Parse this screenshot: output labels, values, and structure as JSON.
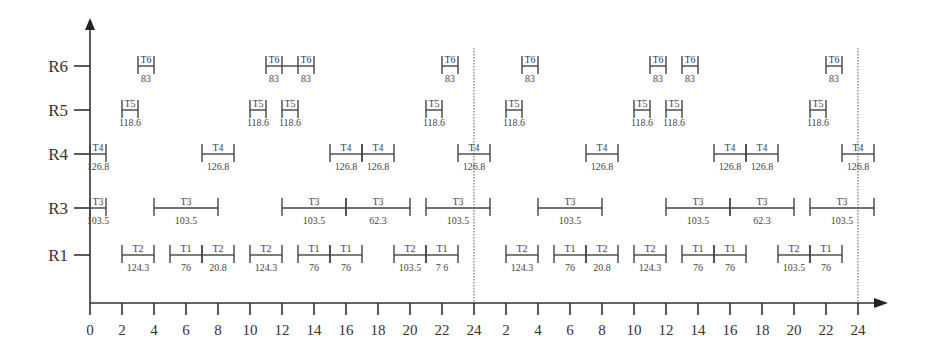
{
  "chart_data": {
    "type": "gantt",
    "title": "",
    "xlabel": "",
    "ylabel": "",
    "x_tick_labels": [
      "0",
      "2",
      "4",
      "6",
      "8",
      "10",
      "12",
      "14",
      "16",
      "18",
      "20",
      "22",
      "24",
      "2",
      "4",
      "6",
      "8",
      "10",
      "12",
      "14",
      "16",
      "18",
      "20",
      "22",
      "24"
    ],
    "x_range_hours": [
      0,
      48
    ],
    "dotted_vertical_lines_at_hours": [
      24,
      48
    ],
    "rows": [
      "R6",
      "R5",
      "R4",
      "R3",
      "R1"
    ],
    "bars": {
      "R6": [
        {
          "task": "T6",
          "value": "83",
          "start": 3,
          "end": 4
        },
        {
          "task": "T6",
          "value": "83",
          "start": 11,
          "end": 12
        },
        {
          "task": "T6",
          "value": "83",
          "start": 13,
          "end": 14
        },
        {
          "task": "T6",
          "value": "83",
          "start": 22,
          "end": 23
        },
        {
          "task": "T6",
          "value": "83",
          "start": 27,
          "end": 28
        },
        {
          "task": "T6",
          "value": "83",
          "start": 35,
          "end": 36
        },
        {
          "task": "T6",
          "value": "83",
          "start": 37,
          "end": 38
        },
        {
          "task": "T6",
          "value": "83",
          "start": 46,
          "end": 47
        }
      ],
      "R5": [
        {
          "task": "T5",
          "value": "118.6",
          "start": 2,
          "end": 3
        },
        {
          "task": "T5",
          "value": "118.6",
          "start": 10,
          "end": 11
        },
        {
          "task": "T5",
          "value": "118.6",
          "start": 12,
          "end": 13
        },
        {
          "task": "T5",
          "value": "118.6",
          "start": 21,
          "end": 22
        },
        {
          "task": "T5",
          "value": "118.6",
          "start": 26,
          "end": 27
        },
        {
          "task": "T5",
          "value": "118.6",
          "start": 34,
          "end": 35
        },
        {
          "task": "T5",
          "value": "118.6",
          "start": 36,
          "end": 37
        },
        {
          "task": "T5",
          "value": "118.6",
          "start": 45,
          "end": 46
        }
      ],
      "R4": [
        {
          "task": "T4",
          "value": "126.8",
          "start": 0,
          "end": 1
        },
        {
          "task": "T4",
          "value": "126.8",
          "start": 7,
          "end": 9
        },
        {
          "task": "T4",
          "value": "126.8",
          "start": 15,
          "end": 17
        },
        {
          "task": "T4",
          "value": "126.8",
          "start": 17,
          "end": 19
        },
        {
          "task": "T4",
          "value": "126.8",
          "start": 23,
          "end": 25
        },
        {
          "task": "T4",
          "value": "126.8",
          "start": 31,
          "end": 33
        },
        {
          "task": "T4",
          "value": "126.8",
          "start": 39,
          "end": 41
        },
        {
          "task": "T4",
          "value": "126.8",
          "start": 41,
          "end": 43
        },
        {
          "task": "T4",
          "value": "126.8",
          "start": 47,
          "end": 49
        }
      ],
      "R3": [
        {
          "task": "T3",
          "value": "103.5",
          "start": 0,
          "end": 1
        },
        {
          "task": "T3",
          "value": "103.5",
          "start": 4,
          "end": 8
        },
        {
          "task": "T3",
          "value": "103.5",
          "start": 12,
          "end": 16
        },
        {
          "task": "T3",
          "value": "62.3",
          "start": 16,
          "end": 20
        },
        {
          "task": "T3",
          "value": "103.5",
          "start": 21,
          "end": 25
        },
        {
          "task": "T3",
          "value": "103.5",
          "start": 28,
          "end": 32
        },
        {
          "task": "T3",
          "value": "103.5",
          "start": 36,
          "end": 40
        },
        {
          "task": "T3",
          "value": "62.3",
          "start": 40,
          "end": 44
        },
        {
          "task": "T3",
          "value": "103.5",
          "start": 45,
          "end": 49
        }
      ],
      "R1": [
        {
          "task": "T2",
          "value": "124.3",
          "start": 2,
          "end": 4
        },
        {
          "task": "T1",
          "value": "76",
          "start": 5,
          "end": 7
        },
        {
          "task": "T2",
          "value": "20.8",
          "start": 7,
          "end": 9
        },
        {
          "task": "T2",
          "value": "124.3",
          "start": 10,
          "end": 12
        },
        {
          "task": "T1",
          "value": "76",
          "start": 13,
          "end": 15
        },
        {
          "task": "T1",
          "value": "76",
          "start": 15,
          "end": 17
        },
        {
          "task": "T2",
          "value": "103.5",
          "start": 19,
          "end": 21
        },
        {
          "task": "T1",
          "value": "7 6",
          "start": 21,
          "end": 23
        },
        {
          "task": "T2",
          "value": "124.3",
          "start": 26,
          "end": 28
        },
        {
          "task": "T1",
          "value": "76",
          "start": 29,
          "end": 31
        },
        {
          "task": "T2",
          "value": "20.8",
          "start": 31,
          "end": 33
        },
        {
          "task": "T2",
          "value": "124.3",
          "start": 34,
          "end": 36
        },
        {
          "task": "T1",
          "value": "76",
          "start": 37,
          "end": 39
        },
        {
          "task": "T1",
          "value": "76",
          "start": 39,
          "end": 41
        },
        {
          "task": "T2",
          "value": "103.5",
          "start": 43,
          "end": 45
        },
        {
          "task": "T1",
          "value": "76",
          "start": 45,
          "end": 47
        }
      ]
    },
    "connectors": [
      {
        "row": "R6",
        "start": 12,
        "end": 13
      }
    ],
    "grid": false,
    "legend": null
  },
  "layout": {
    "origin_x": 90,
    "px_per_hour": 16.0,
    "axis_y": 303,
    "axis_top": 18,
    "axis_right": 888,
    "row_y": {
      "R6": 66,
      "R5": 110,
      "R4": 154,
      "R3": 208,
      "R1": 255
    },
    "label_offsets": {
      "R6": 12,
      "R5": 12,
      "R4": 12,
      "R3": 12,
      "R1": 12
    }
  }
}
